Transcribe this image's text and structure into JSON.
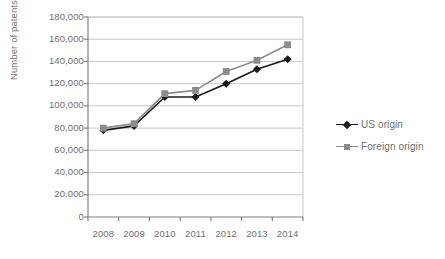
{
  "chart_data": {
    "type": "line",
    "title": "",
    "xlabel": "",
    "ylabel": "Number of patents granted",
    "categories": [
      "2008",
      "2009",
      "2010",
      "2011",
      "2012",
      "2013",
      "2014"
    ],
    "ylim": [
      0,
      180000
    ],
    "ytick_step": 20000,
    "yticks": [
      "0",
      "20,000",
      "40,000",
      "60,000",
      "80,000",
      "100,000",
      "120,000",
      "140,000",
      "160,000",
      "180,000"
    ],
    "ytick_values": [
      0,
      20000,
      40000,
      60000,
      80000,
      100000,
      120000,
      140000,
      160000,
      180000
    ],
    "grid": true,
    "legend_position": "right",
    "series": [
      {
        "name": "US origin",
        "color": "#1a1a1a",
        "marker": "diamond",
        "values": [
          78000,
          82000,
          108000,
          108000,
          120000,
          133000,
          142000
        ]
      },
      {
        "name": "Foreign origin",
        "color": "#8c8c8c",
        "marker": "square",
        "values": [
          80000,
          84000,
          111000,
          114000,
          131000,
          141000,
          155000
        ]
      }
    ]
  },
  "style": {
    "background": "#ffffff",
    "grid_color": "#c8c8c8",
    "axis_color": "#808080",
    "text_color": "#6f6f6f"
  }
}
